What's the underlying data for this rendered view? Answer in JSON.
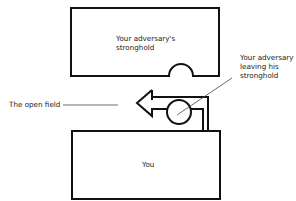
{
  "diagram": {
    "adversary_stronghold": {
      "label_line1": "Your adversary's",
      "label_line2": "stronghold"
    },
    "you": {
      "label": "You"
    },
    "adversary_leaving": {
      "line1": "Your adversary",
      "line2": "leaving his",
      "line3": "stronghold"
    },
    "open_field": {
      "label": "The open field"
    },
    "colors": {
      "stroke": "#111111",
      "leader": "#444444",
      "background": "#ffffff"
    }
  }
}
